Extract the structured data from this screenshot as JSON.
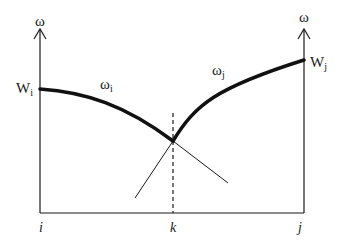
{
  "diagram": {
    "colors": {
      "stroke": "#1a1a1a",
      "background": "#ffffff"
    },
    "axes": {
      "left_axis_label": "ω",
      "right_axis_label": "ω"
    },
    "curves": {
      "left": {
        "label": "ω",
        "subscript": "i",
        "endpoint_label": "W",
        "endpoint_subscript": "i"
      },
      "right": {
        "label": "ω",
        "subscript": "j",
        "endpoint_label": "W",
        "endpoint_subscript": "j"
      }
    },
    "x_labels": {
      "left": "i",
      "middle": "k",
      "right": "j"
    }
  }
}
